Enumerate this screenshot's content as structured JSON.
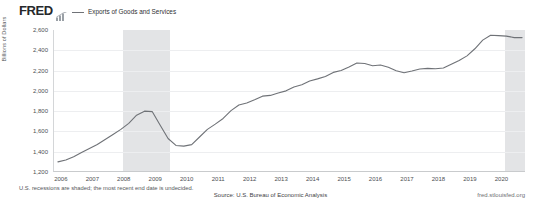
{
  "header": {
    "brand": "FRED",
    "brand_glyph": "bar-chart-icon",
    "legend": [
      {
        "label": "Exports of Goods and Services",
        "color": "#6f7277"
      }
    ]
  },
  "footer": {
    "note": "U.S. recessions are shaded; the most recent end date is undecided.",
    "source": "Source: U.S. Bureau of Economic Analysis",
    "url": "fred.stlouisfed.org"
  },
  "chart_data": {
    "type": "line",
    "title": "Exports of Goods and Services",
    "xlabel": "",
    "ylabel": "Billions of Dollars",
    "ylim": [
      1200,
      2600
    ],
    "xlim": [
      2005.75,
      2020.75
    ],
    "grid": true,
    "legend_position": "top-left",
    "yticks": [
      "2,600",
      "2,400",
      "2,200",
      "2,000",
      "1,800",
      "1,600",
      "1,400",
      "1,200"
    ],
    "ytick_values": [
      2600,
      2400,
      2200,
      2000,
      1800,
      1600,
      1400,
      1200
    ],
    "xticks": [
      "2006",
      "2007",
      "2008",
      "2009",
      "2010",
      "2011",
      "2012",
      "2013",
      "2014",
      "2015",
      "2016",
      "2017",
      "2018",
      "2019",
      "2020"
    ],
    "xtick_values": [
      2006,
      2007,
      2008,
      2009,
      2010,
      2011,
      2012,
      2013,
      2014,
      2015,
      2016,
      2017,
      2018,
      2019,
      2020
    ],
    "series": [
      {
        "name": "Exports of Goods and Services",
        "color": "#6f7277",
        "x": [
          2005.875,
          2006.125,
          2006.375,
          2006.625,
          2006.875,
          2007.125,
          2007.375,
          2007.625,
          2007.875,
          2008.125,
          2008.375,
          2008.625,
          2008.875,
          2009.125,
          2009.375,
          2009.625,
          2009.875,
          2010.125,
          2010.375,
          2010.625,
          2010.875,
          2011.125,
          2011.375,
          2011.625,
          2011.875,
          2012.125,
          2012.375,
          2012.625,
          2012.875,
          2013.125,
          2013.375,
          2013.625,
          2013.875,
          2014.125,
          2014.375,
          2014.625,
          2014.875,
          2015.125,
          2015.375,
          2015.625,
          2015.875,
          2016.125,
          2016.375,
          2016.625,
          2016.875,
          2017.125,
          2017.375,
          2017.625,
          2017.875,
          2018.125,
          2018.375,
          2018.625,
          2018.875,
          2019.125,
          2019.375,
          2019.625,
          2019.875,
          2020.125,
          2020.375,
          2020.625
        ],
        "values": [
          1300,
          1318,
          1350,
          1392,
          1432,
          1472,
          1520,
          1570,
          1620,
          1680,
          1760,
          1800,
          1795,
          1660,
          1530,
          1462,
          1455,
          1470,
          1545,
          1620,
          1672,
          1728,
          1805,
          1860,
          1880,
          1912,
          1948,
          1955,
          1978,
          2000,
          2038,
          2060,
          2098,
          2118,
          2142,
          2182,
          2200,
          2235,
          2275,
          2270,
          2248,
          2255,
          2232,
          2198,
          2178,
          2195,
          2215,
          2222,
          2218,
          2225,
          2262,
          2300,
          2345,
          2415,
          2500,
          2548,
          2545,
          2540,
          2525,
          2525
        ]
      }
    ],
    "recessions": [
      {
        "label": "2007-2009 recession",
        "start": 2007.95,
        "end": 2009.45
      },
      {
        "label": "2020 recession",
        "start": 2020.08,
        "end": 2020.75
      }
    ],
    "annotations": []
  }
}
